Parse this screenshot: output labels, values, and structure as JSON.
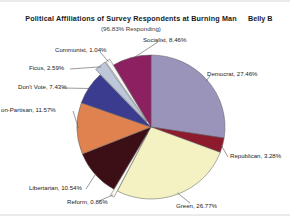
{
  "header": {
    "title": "Political Affiliations of Survey Respondents at Burning Man",
    "subtitle": "(96.83% Responding)",
    "corner_note": "Belly B"
  },
  "chart_data": {
    "type": "pie",
    "title": "Political Affiliations of Survey Respondents at Burning Man",
    "subtitle": "(96.83% Responding)",
    "value_unit": "percent",
    "total": 100,
    "legend": "none (direct slice labels with leader lines)",
    "grid": false,
    "start_angle_deg": 0,
    "direction": "clockwise",
    "labels": [
      "Democrat",
      "Republican",
      "Green",
      "Reform",
      "Libertarian",
      "Non-Partisan",
      "Don't Vote",
      "Ficus",
      "Communist",
      "Socialist"
    ],
    "values": [
      27.46,
      3.28,
      26.77,
      0.86,
      10.54,
      11.57,
      7.43,
      2.59,
      1.04,
      8.46
    ],
    "colors": [
      "#9b94ba",
      "#8d1b2d",
      "#f4f2c2",
      "#fbfaf0",
      "#3c0e16",
      "#e08250",
      "#3b3b8f",
      "#bcc7da",
      "#f4f4f4",
      "#8d2060"
    ],
    "slices": [
      {
        "label": "Democrat",
        "value": 27.46,
        "display": "Democrat, 27.46%",
        "color": "#9b94ba",
        "exploded": false
      },
      {
        "label": "Republican",
        "value": 3.28,
        "display": "Republican, 3.28%",
        "color": "#8d1b2d",
        "exploded": false
      },
      {
        "label": "Green",
        "value": 26.77,
        "display": "Green, 26.77%",
        "color": "#f4f2c2",
        "exploded": false
      },
      {
        "label": "Reform",
        "value": 0.86,
        "display": "Reform, 0.86%",
        "color": "#fbfaf0",
        "exploded": true
      },
      {
        "label": "Libertarian",
        "value": 10.54,
        "display": "Libertarian, 10.54%",
        "color": "#3c0e16",
        "exploded": false
      },
      {
        "label": "Non-Partisan",
        "value": 11.57,
        "display": "on-Partisan, 11.57%",
        "color": "#e08250",
        "exploded": false
      },
      {
        "label": "Don't Vote",
        "value": 7.43,
        "display": "Don't Vote, 7.43%",
        "color": "#3b3b8f",
        "exploded": false
      },
      {
        "label": "Ficus",
        "value": 2.59,
        "display": "Ficus, 2.59%",
        "color": "#bcc7da",
        "exploded": true
      },
      {
        "label": "Communist",
        "value": 1.04,
        "display": "Communist, 1.04%",
        "color": "#f4f4f4",
        "exploded": true
      },
      {
        "label": "Socialist",
        "value": 8.46,
        "display": "Socialist, 8.46%",
        "color": "#8d2060",
        "exploded": false
      }
    ]
  }
}
